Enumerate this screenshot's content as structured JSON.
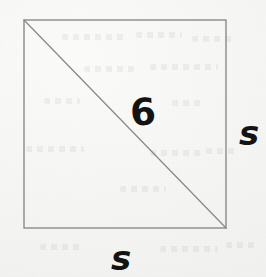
{
  "figure": {
    "canvas": {
      "width": 266,
      "height": 277
    },
    "background_color": "#f7f7f6",
    "stroke_color": "#8a8a8a",
    "label_color": "#131313",
    "shape": {
      "name": "square",
      "left": 24,
      "top": 20,
      "right": 226,
      "bottom": 228,
      "width": 202,
      "height": 208,
      "stroke_width": 1.4
    },
    "diagonal": {
      "name": "diagonal",
      "from_x": 24,
      "from_y": 20,
      "to_x": 226,
      "to_y": 228,
      "stroke_width": 1.3
    },
    "labels": [
      {
        "id": "diagonal-length",
        "text": "6",
        "meaning": "length of the diagonal",
        "x": 130,
        "y": 94
      },
      {
        "id": "right-side-length",
        "text": "s",
        "meaning": "length of the right side of the square",
        "x": 239,
        "y": 116
      },
      {
        "id": "bottom-side-length",
        "text": "s",
        "meaning": "length of the bottom side of the square",
        "x": 111,
        "y": 241
      }
    ],
    "ghost_marks": [
      {
        "x": 62,
        "y": 34,
        "w": 62
      },
      {
        "x": 136,
        "y": 32,
        "w": 46
      },
      {
        "x": 192,
        "y": 36,
        "w": 40
      },
      {
        "x": 84,
        "y": 66,
        "w": 54
      },
      {
        "x": 150,
        "y": 64,
        "w": 68
      },
      {
        "x": 44,
        "y": 98,
        "w": 36
      },
      {
        "x": 172,
        "y": 100,
        "w": 30
      },
      {
        "x": 26,
        "y": 146,
        "w": 58
      },
      {
        "x": 150,
        "y": 150,
        "w": 52
      },
      {
        "x": 206,
        "y": 148,
        "w": 30
      },
      {
        "x": 120,
        "y": 186,
        "w": 46
      },
      {
        "x": 40,
        "y": 244,
        "w": 44
      },
      {
        "x": 160,
        "y": 246,
        "w": 58
      },
      {
        "x": 226,
        "y": 242,
        "w": 30
      }
    ]
  }
}
